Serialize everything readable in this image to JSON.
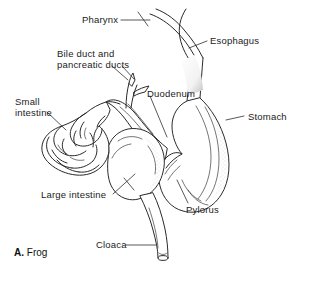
{
  "figure": {
    "caption_prefix": "A.",
    "caption_text": "Frog",
    "background_color": "#ffffff",
    "line_color": "#2a2a2a",
    "text_color": "#1b1b1b"
  },
  "labels": {
    "pharynx": "Pharynx",
    "esophagus": "Esophagus",
    "bile_ducts_line1": "Bile duct and",
    "bile_ducts_line2": "pancreatic ducts",
    "duodenum": "Duodenum",
    "small_intestine_line1": "Small",
    "small_intestine_line2": "intestine",
    "stomach": "Stomach",
    "large_intestine": "Large intestine",
    "pylorus": "Pylorus",
    "cloaca": "Cloaca"
  },
  "structures": {
    "pharynx": "pharynx-tube",
    "esophagus": "esophagus-tube",
    "stomach": "stomach-sac",
    "pylorus": "pylorus-junction",
    "duodenum": "duodenum-loop",
    "bile_pancreatic_ducts": "duct-branches",
    "small_intestine": "small-intestine-coil",
    "large_intestine": "large-intestine-sac",
    "cloaca": "cloaca-opening"
  }
}
